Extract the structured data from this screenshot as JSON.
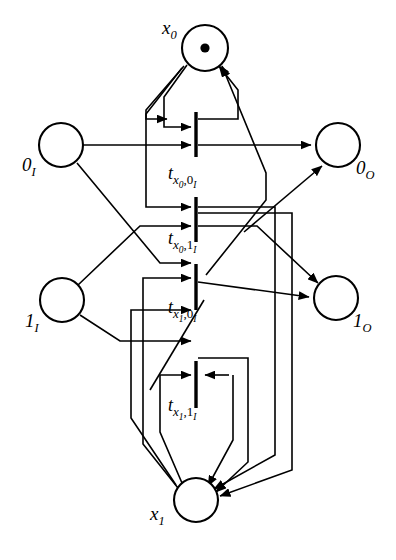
{
  "figure": {
    "type": "petri-net",
    "title": "",
    "background_color": "#ffffff",
    "stroke_color": "#000000"
  },
  "places": [
    {
      "id": "x0",
      "label_base": "x",
      "label_sub": "0",
      "tokens": 1,
      "cx": 205,
      "cy": 48,
      "r": 23,
      "label_x": 162,
      "label_y": 18
    },
    {
      "id": "0I",
      "label_base": "0",
      "label_sub": "I",
      "tokens": 0,
      "cx": 61,
      "cy": 145,
      "r": 22,
      "label_x": 22,
      "label_y": 155
    },
    {
      "id": "0O",
      "label_base": "0",
      "label_sub": "O",
      "tokens": 0,
      "cx": 338,
      "cy": 145,
      "r": 22,
      "label_x": 356,
      "label_y": 158
    },
    {
      "id": "1I",
      "label_base": "1",
      "label_sub": "I",
      "tokens": 0,
      "cx": 62,
      "cy": 300,
      "r": 22,
      "label_x": 25,
      "label_y": 311
    },
    {
      "id": "1O",
      "label_base": "1",
      "label_sub": "O",
      "tokens": 0,
      "cx": 336,
      "cy": 298,
      "r": 22,
      "label_x": 353,
      "label_y": 311
    },
    {
      "id": "x1",
      "label_base": "x",
      "label_sub": "1",
      "tokens": 0,
      "cx": 196,
      "cy": 500,
      "r": 22,
      "label_x": 150,
      "label_y": 504
    }
  ],
  "transitions": [
    {
      "id": "t_x0_0I",
      "t": "t",
      "arg1": "x",
      "arg1_sub": "0",
      "sep": ",",
      "arg2": "0",
      "arg2_sub": "I",
      "bar_x": 196,
      "bar_y0": 112,
      "bar_y1": 157,
      "label_x": 168,
      "label_y": 164
    },
    {
      "id": "t_x0_1I",
      "t": "t",
      "arg1": "x",
      "arg1_sub": "0",
      "sep": ",",
      "arg2": "1",
      "arg2_sub": "I",
      "bar_x": 196,
      "bar_y0": 197,
      "bar_y1": 242,
      "label_x": 168,
      "label_y": 229
    },
    {
      "id": "t_x1_0I",
      "t": "t",
      "arg1": "x",
      "arg1_sub": "1",
      "sep": ",",
      "arg2": "0",
      "arg2_sub": "I",
      "bar_x": 196,
      "bar_y0": 264,
      "bar_y1": 310,
      "label_x": 168,
      "label_y": 298
    },
    {
      "id": "t_x1_1I",
      "t": "t",
      "arg1": "x",
      "arg1_sub": "1",
      "sep": ",",
      "arg2": "1",
      "arg2_sub": "I",
      "bar_x": 196,
      "bar_y0": 361,
      "bar_y1": 408,
      "label_x": 168,
      "label_y": 396
    }
  ],
  "arcs": [
    {
      "id": "arc-x0-to-t-x0-0I",
      "from": "x0",
      "to": "t_x0_0I"
    },
    {
      "id": "arc-t-x0-0I-to-x0",
      "from": "t_x0_0I",
      "to": "x0"
    },
    {
      "id": "arc-0I-to-t-x0-0I",
      "from": "0I",
      "to": "t_x0_0I"
    },
    {
      "id": "arc-t-x0-0I-to-0O",
      "from": "t_x0_0I",
      "to": "0O"
    },
    {
      "id": "arc-x0-to-t-x0-1I",
      "from": "x0",
      "to": "t_x0_1I"
    },
    {
      "id": "arc-1I-to-t-x0-1I",
      "from": "1I",
      "to": "t_x0_1I"
    },
    {
      "id": "arc-t-x0-1I-to-x1",
      "from": "t_x0_1I",
      "to": "x1"
    },
    {
      "id": "arc-t-x0-1I-to-1O",
      "from": "t_x0_1I",
      "to": "1O"
    },
    {
      "id": "arc-x1-to-t-x1-0I",
      "from": "x1",
      "to": "t_x1_0I"
    },
    {
      "id": "arc-0I-to-t-x1-0I",
      "from": "0I",
      "to": "t_x1_0I"
    },
    {
      "id": "arc-t-x1-0I-to-x0",
      "from": "t_x1_0I",
      "to": "x0"
    },
    {
      "id": "arc-t-x1-0I-to-1O",
      "from": "t_x1_0I",
      "to": "1O"
    },
    {
      "id": "arc-x1-to-t-x1-1I",
      "from": "x1",
      "to": "t_x1_1I"
    },
    {
      "id": "arc-1I-to-t-x1-1I",
      "from": "1I",
      "to": "t_x1_1I"
    },
    {
      "id": "arc-t-x1-1I-to-x1",
      "from": "t_x1_1I",
      "to": "x1"
    },
    {
      "id": "arc-t-x1-1I-to-0O",
      "from": "t_x1_1I",
      "to": "0O"
    }
  ]
}
